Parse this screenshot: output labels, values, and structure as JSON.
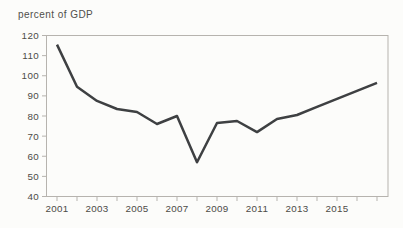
{
  "chart": {
    "title": "percent of GDP"
  },
  "chart_data": {
    "type": "line",
    "title": "percent of GDP",
    "ylabel": "percent of GDP",
    "xlabel": "",
    "x": [
      2001,
      2002,
      2003,
      2004,
      2005,
      2006,
      2007,
      2008,
      2009,
      2010,
      2011,
      2012,
      2013,
      2014,
      2015,
      2016,
      2017
    ],
    "values": [
      115.5,
      94.5,
      87.5,
      83.5,
      82,
      76,
      80,
      57,
      76.5,
      77.5,
      72,
      78.5,
      80.5,
      84.5,
      88.5,
      92.5,
      96.5
    ],
    "ylim": [
      40,
      120
    ],
    "y_ticks": [
      40,
      50,
      60,
      70,
      80,
      90,
      100,
      110,
      120
    ],
    "x_labeled_ticks": [
      2001,
      2003,
      2005,
      2007,
      2009,
      2011,
      2013,
      2015
    ],
    "x_minor_ticks": [
      2001,
      2002,
      2003,
      2004,
      2005,
      2006,
      2007,
      2008,
      2009,
      2010,
      2011,
      2012,
      2013,
      2014,
      2015,
      2016,
      2017
    ],
    "grid": false,
    "legend": "none",
    "line_color": "#3e4042",
    "axis_color": "#b6b3ae",
    "label_color": "#4c4b47"
  }
}
